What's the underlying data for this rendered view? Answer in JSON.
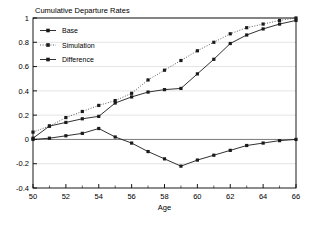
{
  "chart_data": {
    "type": "line",
    "title": "Cumulative Departure Rates",
    "xlabel": "Age",
    "ylabel": "",
    "xlim": [
      50,
      66
    ],
    "ylim": [
      -0.4,
      1.0
    ],
    "xticks": [
      50,
      52,
      54,
      56,
      58,
      60,
      62,
      64,
      66
    ],
    "xticklabels": [
      "50",
      "52",
      "54",
      "56",
      "58",
      "60",
      "62",
      "64",
      "66"
    ],
    "xminorticks": [
      51,
      53,
      55,
      57,
      59,
      61,
      63,
      65
    ],
    "yticks": [
      -0.4,
      -0.2,
      0,
      0.2,
      0.4,
      0.6,
      0.8,
      1.0
    ],
    "yticklabels": [
      "-0.4",
      "-0.2",
      "0",
      "0.2",
      "0.4",
      "0.6",
      "0.8",
      "1"
    ],
    "grid": true,
    "grid_axis": "y",
    "legend_position": "upper left",
    "zero_line": true,
    "x": [
      50,
      51,
      52,
      53,
      54,
      55,
      56,
      57,
      58,
      59,
      60,
      61,
      62,
      63,
      64,
      65,
      66
    ],
    "series": [
      {
        "name": "Base",
        "style": "solid",
        "marker": "square",
        "color": "#1a1a1a",
        "values": [
          0.01,
          0.11,
          0.14,
          0.17,
          0.19,
          0.3,
          0.35,
          0.39,
          0.41,
          0.42,
          0.54,
          0.66,
          0.79,
          0.86,
          0.91,
          0.95,
          0.98
        ]
      },
      {
        "name": "Simulation",
        "style": "dotted",
        "marker": "square",
        "color": "#4d4d4d",
        "values": [
          0.06,
          0.11,
          0.18,
          0.23,
          0.28,
          0.32,
          0.38,
          0.49,
          0.57,
          0.65,
          0.73,
          0.8,
          0.87,
          0.92,
          0.95,
          0.98,
          1.0
        ]
      },
      {
        "name": "Difference",
        "style": "solid",
        "marker": "square",
        "color": "#1a1a1a",
        "values": [
          0.0,
          0.01,
          0.03,
          0.05,
          0.09,
          0.02,
          -0.03,
          -0.1,
          -0.16,
          -0.22,
          -0.17,
          -0.13,
          -0.09,
          -0.05,
          -0.03,
          -0.01,
          0.0
        ]
      }
    ]
  },
  "legend": {
    "items": [
      {
        "label": "Base"
      },
      {
        "label": "Simulation"
      },
      {
        "label": "Difference"
      }
    ]
  }
}
